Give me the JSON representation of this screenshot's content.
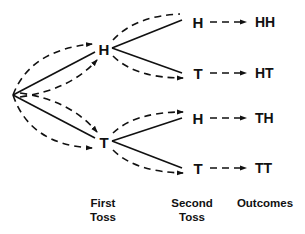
{
  "first_toss": {
    "heads": "H",
    "tails": "T"
  },
  "second_toss": {
    "after_heads": {
      "heads": "H",
      "tails": "T"
    },
    "after_tails": {
      "heads": "H",
      "tails": "T"
    }
  },
  "outcomes": [
    "HH",
    "HT",
    "TH",
    "TT"
  ],
  "labels": {
    "first_toss_line1": "First",
    "first_toss_line2": "Toss",
    "second_toss_line1": "Second",
    "second_toss_line2": "Toss",
    "outcomes": "Outcomes"
  },
  "colors": {
    "line": "#111111",
    "background": "#ffffff"
  }
}
